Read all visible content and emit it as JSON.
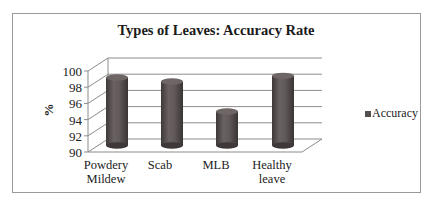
{
  "chart_data": {
    "type": "bar",
    "style": "3d-cylinder",
    "title": "Types of Leaves: Accuracy Rate",
    "xlabel": "",
    "ylabel": "%",
    "categories": [
      "Powdery Mildew",
      "Scab",
      "MLB",
      "Healthy leave"
    ],
    "category_lines": [
      [
        "Powdery",
        "Mildew"
      ],
      [
        "Scab"
      ],
      [
        "MLB"
      ],
      [
        "Healthy",
        "leave"
      ]
    ],
    "series": [
      {
        "name": "Accuracy",
        "values": [
          98.4,
          97.9,
          94.2,
          98.6
        ],
        "color": "#5a5252"
      }
    ],
    "ylim": [
      90,
      100
    ],
    "yticks": [
      "90",
      "92",
      "94",
      "96",
      "98",
      "100"
    ],
    "grid": true,
    "legend_position": "right"
  },
  "legend": {
    "label": "Accuracy"
  }
}
